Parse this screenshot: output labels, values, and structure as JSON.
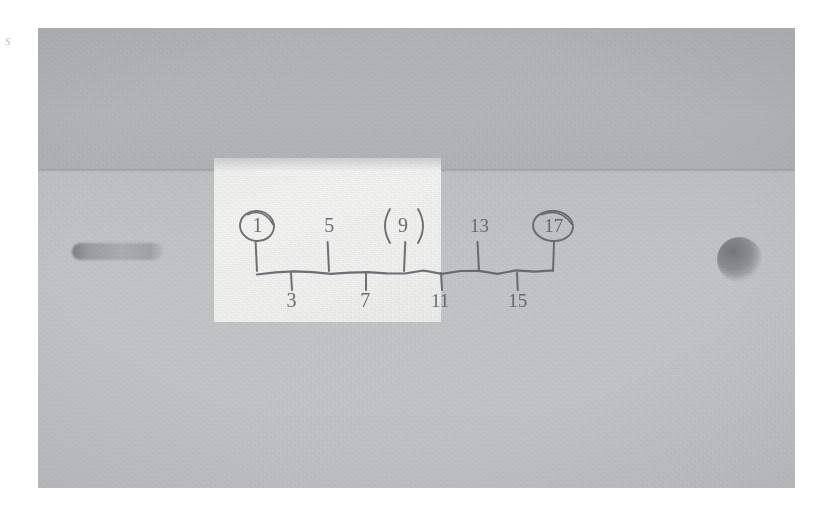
{
  "scene": {
    "kind": "photograph",
    "subject": "hand-drawn number line on white paper taped to a gray surface",
    "stray_mark": "s"
  },
  "surface": {
    "label": "gray-surface",
    "upper_band_color": "#b6b8ba",
    "lower_band_color": "#c4c6c7",
    "features": [
      {
        "name": "slot-shadow",
        "shape": "rounded-slot"
      },
      {
        "name": "round-hole",
        "shape": "circle"
      }
    ]
  },
  "paper": {
    "label": "white-paper-patch",
    "color": "#f4f4f3"
  },
  "chart_data": {
    "type": "number-line",
    "title": "",
    "xlabel": "",
    "ylabel": "",
    "ink_color": "#5f6164",
    "axis": {
      "start_value": 1,
      "end_value": 17,
      "step": 2,
      "line_y": 244,
      "x_start": 219,
      "x_end": 515,
      "tick_spacing_px": 37
    },
    "ticks": [
      {
        "value": 1,
        "label": "1",
        "x": 219,
        "side": "above",
        "tick_direction": "up",
        "circled": true,
        "circle_style": "oval"
      },
      {
        "value": 3,
        "label": "3",
        "x": 253,
        "side": "below",
        "tick_direction": "down",
        "circled": false,
        "circle_style": ""
      },
      {
        "value": 5,
        "label": "5",
        "x": 291,
        "side": "above",
        "tick_direction": "up",
        "circled": false,
        "circle_style": ""
      },
      {
        "value": 7,
        "label": "7",
        "x": 328,
        "side": "below",
        "tick_direction": "down",
        "circled": false,
        "circle_style": ""
      },
      {
        "value": 9,
        "label": "9",
        "x": 366,
        "side": "above",
        "tick_direction": "up",
        "circled": true,
        "circle_style": "parentheses"
      },
      {
        "value": 11,
        "label": "11",
        "x": 403,
        "side": "below",
        "tick_direction": "down",
        "circled": false,
        "circle_style": ""
      },
      {
        "value": 13,
        "label": "13",
        "x": 441,
        "side": "above",
        "tick_direction": "up",
        "circled": false,
        "circle_style": ""
      },
      {
        "value": 15,
        "label": "15",
        "x": 479,
        "side": "below",
        "tick_direction": "down",
        "circled": false,
        "circle_style": ""
      },
      {
        "value": 17,
        "label": "17",
        "x": 515,
        "side": "above",
        "tick_direction": "up",
        "circled": true,
        "circle_style": "oval"
      }
    ],
    "highlighted_values": [
      1,
      9,
      17
    ],
    "sequence_note": "odd numbers"
  }
}
